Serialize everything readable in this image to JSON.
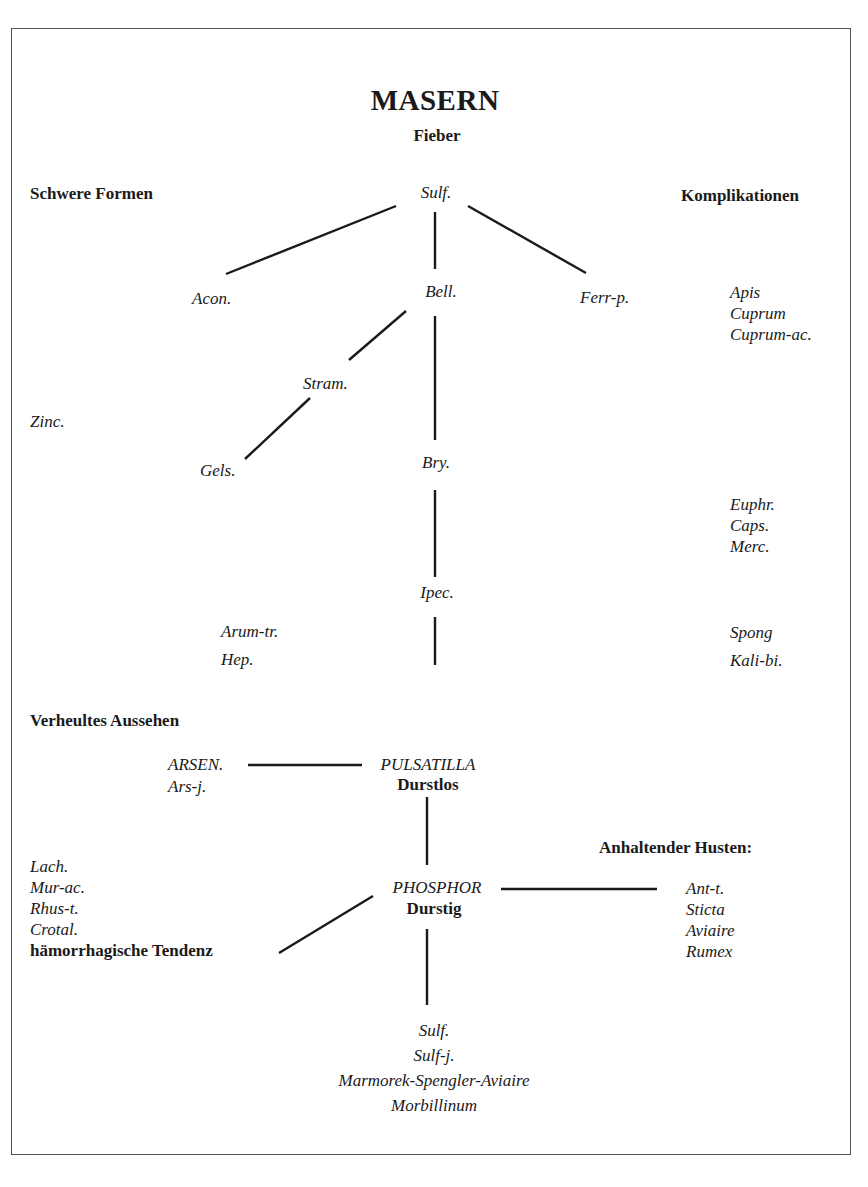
{
  "title": "MASERN",
  "headings": {
    "fieber": "Fieber",
    "schwere_formen": "Schwere Formen",
    "komplikationen": "Komplikationen",
    "verheultes_aussehen": "Verheultes Aussehen",
    "anhaltender_husten": "Anhaltender Husten:"
  },
  "upper_tree": {
    "root": "Sulf.",
    "acon": "Acon.",
    "bell": "Bell.",
    "ferr_p": "Ferr-p.",
    "stram": "Stram.",
    "gels": "Gels.",
    "bry": "Bry.",
    "ipec": "Ipec.",
    "zinc": "Zinc.",
    "arum_group": [
      "Arum-tr.",
      "Hep."
    ]
  },
  "komplikationen_groups": [
    [
      "Apis",
      "Cuprum",
      "Cuprum-ac."
    ],
    [
      "Euphr.",
      "Caps.",
      "Merc."
    ],
    [
      "Spong",
      "Kali-bi."
    ]
  ],
  "lower_tree": {
    "arsen": "ARSEN.",
    "ars_j": "Ars-j.",
    "pulsatilla": "PULSATILLA",
    "durstlos": "Durstlos",
    "phosphor": "PHOSPHOR",
    "durstig": "Durstig",
    "haemorrhagic_group": [
      "Lach.",
      "Mur-ac.",
      "Rhus-t.",
      "Crotal."
    ],
    "haemorrhagic_label": "hämorrhagische Tendenz",
    "cough_group": [
      "Ant-t.",
      "Sticta",
      "Aviaire",
      "Rumex"
    ],
    "bottom_group": [
      "Sulf.",
      "Sulf-j.",
      "Marmorek-Spengler-Aviaire",
      "Morbillinum"
    ]
  }
}
